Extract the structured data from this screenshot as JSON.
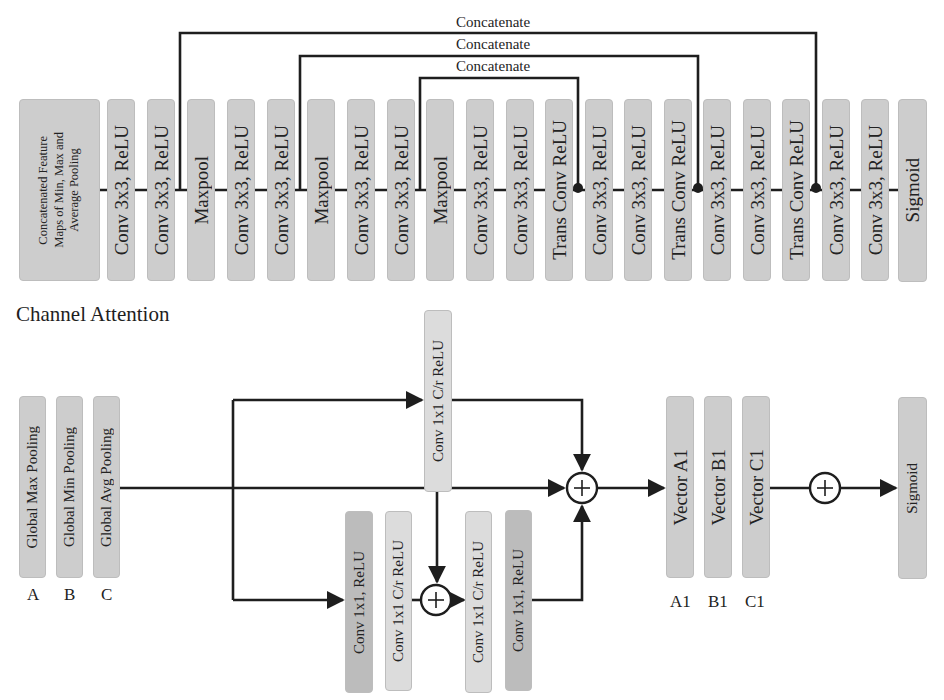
{
  "diagram": {
    "colors": {
      "block_fill": "#cdcdcd",
      "block_fill_light": "#dcdcdc",
      "block_fill_dark": "#bcbcbc",
      "line": "#1e1e1e",
      "background": "#ffffff"
    },
    "unet": {
      "concat_labels": [
        "Concatenate",
        "Concatenate",
        "Concatenate"
      ],
      "blocks": [
        {
          "label": "Concatenated Feature\nMaps of Min, Max and\nAverage Pooling"
        },
        {
          "label": "Conv 3x3, ReLU"
        },
        {
          "label": "Conv 3x3, ReLU"
        },
        {
          "label": "Maxpool"
        },
        {
          "label": "Conv 3x3, ReLU"
        },
        {
          "label": "Conv 3x3, ReLU"
        },
        {
          "label": "Maxpool"
        },
        {
          "label": "Conv 3x3, ReLU"
        },
        {
          "label": "Conv 3x3, ReLU"
        },
        {
          "label": "Maxpool"
        },
        {
          "label": "Conv 3x3, ReLU"
        },
        {
          "label": "Conv 3x3, ReLU"
        },
        {
          "label": "Trans Conv ReLU"
        },
        {
          "label": "Conv 3x3, ReLU"
        },
        {
          "label": "Conv 3x3, ReLU"
        },
        {
          "label": "Trans Conv ReLU"
        },
        {
          "label": "Conv 3x3, ReLU"
        },
        {
          "label": "Conv 3x3, ReLU"
        },
        {
          "label": "Trans Conv ReLU"
        },
        {
          "label": "Conv 3x3, ReLU"
        },
        {
          "label": "Conv 3x3, ReLU"
        },
        {
          "label": "Sigmoid"
        }
      ]
    },
    "channel_attention": {
      "title": "Channel Attention",
      "pooling": [
        {
          "label": "Global Max Pooling",
          "caption": "A"
        },
        {
          "label": "Global Min Pooling",
          "caption": "B"
        },
        {
          "label": "Global Avg Pooling",
          "caption": "C"
        }
      ],
      "top_conv": {
        "label": "Conv 1x1 C/r ReLU"
      },
      "bottom_convs": [
        {
          "label": "Conv 1x1, ReLU"
        },
        {
          "label": "Conv 1x1 C/r ReLU"
        },
        {
          "label": "Conv 1x1 C/r ReLU"
        },
        {
          "label": "Conv 1x1, ReLU"
        }
      ],
      "vectors": [
        {
          "label": "Vector A1",
          "caption": "A1"
        },
        {
          "label": "Vector B1",
          "caption": "B1"
        },
        {
          "label": "Vector C1",
          "caption": "C1"
        }
      ],
      "output": {
        "label": "Sigmoid"
      },
      "add_symbol": "+"
    }
  }
}
